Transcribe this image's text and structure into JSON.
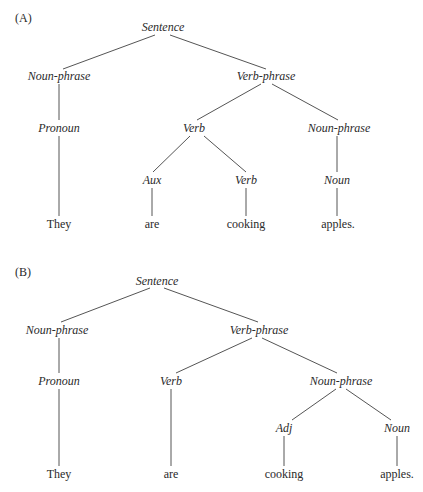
{
  "diagrams": [
    {
      "label": "(A)",
      "nodes": {
        "s": "Sentence",
        "np": "Noun-phrase",
        "vp": "Verb-phrase",
        "pron": "Pronoun",
        "v": "Verb",
        "np2": "Noun-phrase",
        "aux": "Aux",
        "v2": "Verb",
        "n": "Noun",
        "w1": "They",
        "w2": "are",
        "w3": "cooking",
        "w4": "apples."
      }
    },
    {
      "label": "(B)",
      "nodes": {
        "s": "Sentence",
        "np": "Noun-phrase",
        "vp": "Verb-phrase",
        "pron": "Pronoun",
        "v": "Verb",
        "np2": "Noun-phrase",
        "adj": "Adj",
        "n": "Noun",
        "w1": "They",
        "w2": "are",
        "w3": "cooking",
        "w4": "apples."
      }
    }
  ]
}
